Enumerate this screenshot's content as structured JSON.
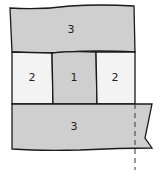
{
  "diagram": {
    "type": "quilt-block-layout",
    "colors": {
      "shaded": "#cfcfcf",
      "light": "#f3f3f3",
      "outline": "#1a1a1a",
      "dashed": "#333333"
    },
    "panels": [
      {
        "id": "top",
        "label": "3",
        "fill": "shaded"
      },
      {
        "id": "middle-left",
        "label": "2",
        "fill": "light"
      },
      {
        "id": "middle-center",
        "label": "1",
        "fill": "shaded"
      },
      {
        "id": "middle-right",
        "label": "2",
        "fill": "light"
      },
      {
        "id": "bottom",
        "label": "3",
        "fill": "shaded"
      }
    ]
  }
}
